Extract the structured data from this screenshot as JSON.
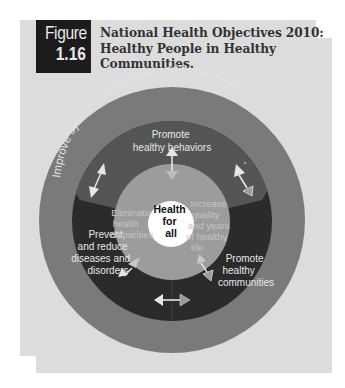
{
  "figure": {
    "label_word": "Figure",
    "label_number": "1.16",
    "title_lines": [
      "National Health Objectives 2010:",
      "Healthy People in Healthy",
      "Communities."
    ]
  },
  "diagram": {
    "outer_ring_text": "Improve systems for personal and public health",
    "segments": {
      "top": [
        "Promote",
        "healthy behaviors"
      ],
      "left": [
        "Prevent",
        "and reduce",
        "diseases and",
        "disorders"
      ],
      "right": [
        "Promote",
        "healthy",
        "communities"
      ]
    },
    "inner_goals": {
      "left": [
        "Eliminate",
        "health",
        "disparities"
      ],
      "right": [
        "Increase",
        "quality",
        "and years",
        "of healthy",
        "life"
      ]
    },
    "center": [
      "Health",
      "for",
      "all"
    ],
    "colors": {
      "panel": "#dcdcdc",
      "outer_ring": "#7a7a7a",
      "middle_top": "#555555",
      "middle_bottom": "#2b2b2b",
      "inner_circle": "#9c9c9c",
      "center": "#ffffff",
      "figure_box": "#1c1c1c"
    }
  }
}
